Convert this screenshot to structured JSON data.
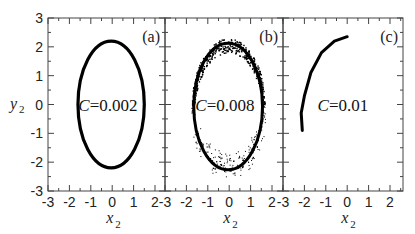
{
  "chart_data": {
    "type": "scatter",
    "layout": "three side-by-side panels sharing y-axis",
    "ylabel": "y2",
    "xlabel": "x2",
    "ylim": [
      -3,
      3
    ],
    "xlim": [
      -3,
      2.5
    ],
    "yticks": [
      "3",
      "2",
      "1",
      "0",
      "-1",
      "-2",
      "-3"
    ],
    "xticks": [
      "-3",
      "-2",
      "-1",
      "0",
      "1",
      "2"
    ],
    "grid": false,
    "panels": [
      {
        "tag": "(a)",
        "annotation_var": "C",
        "annotation_value": "=0.002",
        "description": "closed thin ellipse (limit cycle)",
        "shape": {
          "kind": "ellipse",
          "cx": -0.05,
          "cy": 0.0,
          "rx": 1.55,
          "ry": 2.2
        }
      },
      {
        "tag": "(b)",
        "annotation_var": "C",
        "annotation_value": "=0.008",
        "description": "thick noisy ellipse, scattered points in lower half",
        "shape": {
          "kind": "scattered-ellipse",
          "cx": -0.05,
          "cy": 0.0,
          "rx": 1.7,
          "ry": 2.3
        }
      },
      {
        "tag": "(c)",
        "annotation_var": "C",
        "annotation_value": "=0.01",
        "description": "single arc from (0, 2.3) to (-2.1, -0.9)",
        "shape": {
          "kind": "arc",
          "points": [
            [
              0.0,
              2.35
            ],
            [
              -0.6,
              2.2
            ],
            [
              -1.2,
              1.8
            ],
            [
              -1.7,
              1.1
            ],
            [
              -2.0,
              0.3
            ],
            [
              -2.15,
              -0.3
            ],
            [
              -2.1,
              -0.9
            ]
          ]
        }
      }
    ]
  },
  "labels": {
    "y_main": "y",
    "y_sub": "2",
    "x_main": "x",
    "x_sub": "2"
  }
}
